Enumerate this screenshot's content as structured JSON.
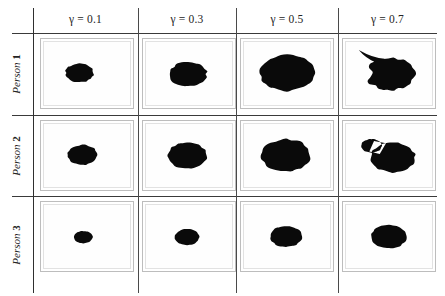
{
  "figure": {
    "type": "image-grid",
    "background_color": "#ffffff",
    "blob_color": "#0a0a0a",
    "cell_border_color": "#bdbdbd",
    "rule_color": "#3a3a3a"
  },
  "columns": [
    {
      "id": "g01",
      "label": "γ = 0.1",
      "symbol": "γ",
      "value": "0.1"
    },
    {
      "id": "g03",
      "label": "γ = 0.3",
      "symbol": "γ",
      "value": "0.3"
    },
    {
      "id": "g05",
      "label": "γ = 0.5",
      "symbol": "γ",
      "value": "0.5"
    },
    {
      "id": "g07",
      "label": "γ = 0.7",
      "symbol": "γ",
      "value": "0.7"
    }
  ],
  "rows": [
    {
      "id": "p1",
      "label": "Person 1",
      "name": "Person",
      "index": "1"
    },
    {
      "id": "p2",
      "label": "Person 2",
      "name": "Person",
      "index": "2"
    },
    {
      "id": "p3",
      "label": "Person 3",
      "name": "Person",
      "index": "3"
    }
  ],
  "cells": [
    {
      "row": "p1",
      "col": "g01",
      "shape": "circle",
      "cx": 38,
      "cy": 50,
      "r": 15,
      "wobble": 0.06
    },
    {
      "row": "p1",
      "col": "g03",
      "shape": "circle",
      "cx": 45,
      "cy": 52,
      "r": 20,
      "wobble": 0.07
    },
    {
      "row": "p1",
      "col": "g05",
      "shape": "circle",
      "cx": 46,
      "cy": 50,
      "r": 29,
      "wobble": 0.05
    },
    {
      "row": "p1",
      "col": "g07",
      "shape": "spike-left",
      "cx": 48,
      "cy": 52,
      "r": 26,
      "wobble": 0.08
    },
    {
      "row": "p2",
      "col": "g01",
      "shape": "circle",
      "cx": 41,
      "cy": 50,
      "r": 16,
      "wobble": 0.05
    },
    {
      "row": "p2",
      "col": "g03",
      "shape": "circle",
      "cx": 44,
      "cy": 51,
      "r": 21,
      "wobble": 0.05
    },
    {
      "row": "p2",
      "col": "g05",
      "shape": "circle",
      "cx": 45,
      "cy": 51,
      "r": 26,
      "wobble": 0.06
    },
    {
      "row": "p2",
      "col": "g07",
      "shape": "lobe-left",
      "cx": 50,
      "cy": 54,
      "r": 24,
      "wobble": 0.05
    },
    {
      "row": "p3",
      "col": "g01",
      "shape": "circle",
      "cx": 42,
      "cy": 52,
      "r": 10,
      "wobble": 0.04
    },
    {
      "row": "p3",
      "col": "g03",
      "shape": "circle",
      "cx": 44,
      "cy": 52,
      "r": 13,
      "wobble": 0.04
    },
    {
      "row": "p3",
      "col": "g05",
      "shape": "circle",
      "cx": 45,
      "cy": 51,
      "r": 17,
      "wobble": 0.04
    },
    {
      "row": "p3",
      "col": "g07",
      "shape": "circle",
      "cx": 46,
      "cy": 51,
      "r": 19,
      "wobble": 0.04
    }
  ],
  "geometry": {
    "width": 445,
    "height": 296,
    "header_rule_y": 33,
    "row_rule_y": [
      115,
      196
    ],
    "vrule_x": [
      33,
      138,
      236,
      338
    ],
    "vrule_top": 8,
    "vrule_bottom": 293,
    "hrule_x0": 12,
    "hrule_x1": 437,
    "cell_x": [
      40,
      142,
      240,
      342
    ],
    "cell_y": [
      38,
      120,
      201
    ],
    "cell_w": 94,
    "cell_h": 71
  }
}
